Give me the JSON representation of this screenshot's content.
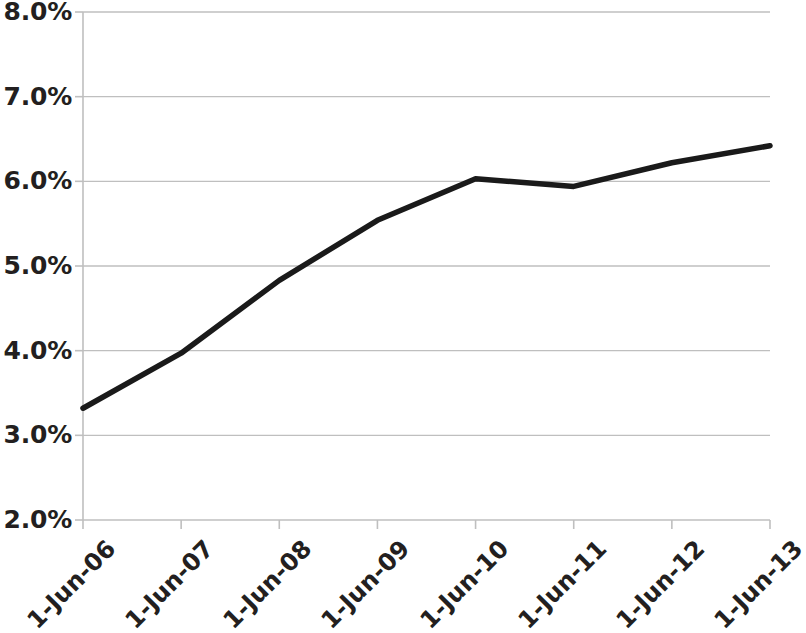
{
  "chart_data": {
    "type": "line",
    "title": "",
    "subtitle": "",
    "xlabel": "",
    "ylabel": "",
    "categories": [
      "1-Jun-06",
      "1-Jun-07",
      "1-Jun-08",
      "1-Jun-09",
      "1-Jun-10",
      "1-Jun-11",
      "1-Jun-12",
      "1-Jun-13"
    ],
    "values": [
      3.32,
      3.97,
      4.83,
      5.54,
      6.03,
      5.94,
      6.22,
      6.42
    ],
    "value_unit": "%",
    "series": [
      {
        "name": "",
        "values": [
          3.32,
          3.97,
          4.83,
          5.54,
          6.03,
          5.94,
          6.22,
          6.42
        ],
        "color": "#1a1a1a",
        "line_width": 5.5,
        "markers": false
      }
    ],
    "ylim": [
      2.0,
      8.0
    ],
    "y_ticks": [
      2.0,
      3.0,
      4.0,
      5.0,
      6.0,
      7.0,
      8.0
    ],
    "y_tick_labels": [
      "2.0%",
      "3.0%",
      "4.0%",
      "5.0%",
      "6.0%",
      "7.0%",
      "8.0%"
    ],
    "x_tick_labels": [
      "1-Jun-06",
      "1-Jun-07",
      "1-Jun-08",
      "1-Jun-09",
      "1-Jun-10",
      "1-Jun-11",
      "1-Jun-12",
      "1-Jun-13"
    ],
    "x_tick_label_rotation_deg": -45,
    "grid": {
      "horizontal": true,
      "vertical": false,
      "color": "#bfbfbf"
    },
    "axis": {
      "line_color": "#bfbfbf",
      "tick_marks": true,
      "left_axis_visible": true,
      "bottom_axis_visible": true,
      "top_axis_visible": false,
      "right_axis_visible": false
    },
    "legend": {
      "visible": false,
      "position": "none",
      "entries": []
    },
    "plot_area_px": {
      "left": 83,
      "right": 770,
      "top": 12,
      "bottom": 520
    },
    "background_color": "#ffffff",
    "text_color": "#231f20"
  }
}
